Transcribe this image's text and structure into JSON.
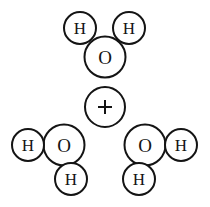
{
  "figure": {
    "background_color": "#ffffff",
    "stroke_color": "#141414",
    "fill_color": "#ffffff",
    "width": 210,
    "height": 207
  },
  "operator": {
    "symbol": "+",
    "name": "plus-operator",
    "cx": 105,
    "cy": 107,
    "r": 20,
    "stroke_width": 2,
    "glyph_half_length": 7,
    "glyph_stroke_width": 2
  },
  "molecules": [
    {
      "name": "water-molecule-top",
      "formula": "H2O",
      "atoms": [
        {
          "name": "hydrogen-atom-top-left",
          "element": "H",
          "cx": 80,
          "cy": 28,
          "r": 16,
          "font_size": 17,
          "stroke_width": 2
        },
        {
          "name": "hydrogen-atom-top-right",
          "element": "H",
          "cx": 129,
          "cy": 28,
          "r": 16,
          "font_size": 17,
          "stroke_width": 2
        },
        {
          "name": "oxygen-atom-top",
          "element": "O",
          "cx": 105,
          "cy": 57,
          "r": 20.5,
          "font_size": 19,
          "stroke_width": 2
        }
      ]
    },
    {
      "name": "water-molecule-bottom-left",
      "formula": "H2O",
      "atoms": [
        {
          "name": "hydrogen-atom-bottom-left-side",
          "element": "H",
          "cx": 28,
          "cy": 145,
          "r": 16,
          "font_size": 17,
          "stroke_width": 2
        },
        {
          "name": "oxygen-atom-bottom-left",
          "element": "O",
          "cx": 64,
          "cy": 145,
          "r": 20.5,
          "font_size": 19,
          "stroke_width": 2
        },
        {
          "name": "hydrogen-atom-bottom-left-below",
          "element": "H",
          "cx": 71,
          "cy": 179,
          "r": 16,
          "font_size": 17,
          "stroke_width": 2
        }
      ]
    },
    {
      "name": "water-molecule-bottom-right",
      "formula": "H2O",
      "atoms": [
        {
          "name": "oxygen-atom-bottom-right",
          "element": "O",
          "cx": 145,
          "cy": 145,
          "r": 20.5,
          "font_size": 19,
          "stroke_width": 2
        },
        {
          "name": "hydrogen-atom-bottom-right-side",
          "element": "H",
          "cx": 181,
          "cy": 145,
          "r": 16,
          "font_size": 17,
          "stroke_width": 2
        },
        {
          "name": "hydrogen-atom-bottom-right-below",
          "element": "H",
          "cx": 139,
          "cy": 179,
          "r": 16,
          "font_size": 17,
          "stroke_width": 2
        }
      ]
    }
  ]
}
